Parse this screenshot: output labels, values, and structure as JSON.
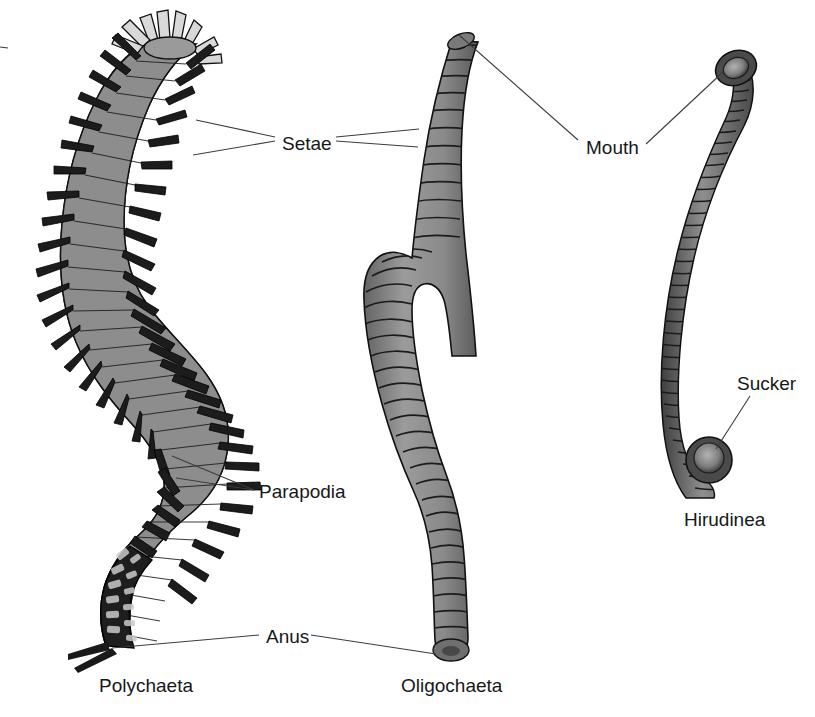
{
  "figure": {
    "background_color": "#ffffff",
    "text_color": "#16181a",
    "leader_color": "#3a3d40",
    "body_fill": "#8d8d8d",
    "body_fill_dark": "#2b2b2b",
    "body_outline": "#111111"
  },
  "callouts": [
    {
      "id": "setae",
      "label": "Setae",
      "x": 282,
      "y": 143
    },
    {
      "id": "mouth",
      "label": "Mouth",
      "x": 586,
      "y": 147
    },
    {
      "id": "parapodia",
      "label": "Parapodia",
      "x": 259,
      "y": 495
    },
    {
      "id": "sucker",
      "label": "Sucker",
      "x": 737,
      "y": 387
    },
    {
      "id": "anus",
      "label": "Anus",
      "x": 266,
      "y": 640
    }
  ],
  "taxa": [
    {
      "id": "polychaeta",
      "label": "Polychaeta",
      "x": 99,
      "y": 692
    },
    {
      "id": "oligochaeta",
      "label": "Oligochaeta",
      "x": 401,
      "y": 692
    },
    {
      "id": "hirudinea",
      "label": "Hirudinea",
      "x": 684,
      "y": 526
    }
  ]
}
